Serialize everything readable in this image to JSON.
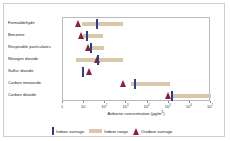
{
  "chart_data": {
    "type": "bar",
    "title": "",
    "xlabel": "Airborne concentration (µg/m³)",
    "ylabel": "",
    "scale": "log10",
    "xlim": [
      1,
      10000000
    ],
    "grid": false,
    "legend_position": "bottom",
    "tick_labels": [
      "1",
      "10",
      "10²",
      "10³",
      "10⁴",
      "10⁵",
      "10⁶",
      "10⁷"
    ],
    "tick_values": [
      1,
      10,
      100,
      1000,
      10000,
      100000,
      1000000,
      10000000
    ],
    "categories": [
      "Formaldehyde",
      "Benzene",
      "Respirable particulates",
      "Nitrogen dioxide",
      "Sulfur dioxide",
      "Carbon monoxide",
      "Carbon dioxide"
    ],
    "series": [
      {
        "name": "Indoor average",
        "color": "#2b3d8f",
        "marker": "vertical-bar",
        "values": [
          40,
          13,
          22,
          45,
          9,
          2500,
          150000
        ]
      },
      {
        "name": "Indoor range",
        "color": "#d9c7ac",
        "marker": "range-bar",
        "ranges": [
          [
            8,
            700
          ],
          [
            9,
            80
          ],
          [
            20,
            90
          ],
          [
            4,
            700
          ],
          null,
          [
            1600,
            120000
          ],
          [
            130000,
            10000000
          ]
        ]
      },
      {
        "name": "Outdoor average",
        "color": "#8c2038",
        "marker": "triangle",
        "values": [
          5,
          7,
          15,
          40,
          18,
          700,
          90000
        ]
      }
    ]
  },
  "legend": {
    "items": [
      {
        "label": "Indoor average",
        "icon": "indoor-average-swatch"
      },
      {
        "label": "Indoor range",
        "icon": "indoor-range-swatch"
      },
      {
        "label": "Outdoor average",
        "icon": "outdoor-average-swatch"
      }
    ]
  },
  "colors": {
    "indoor_average": "#2b3d8f",
    "indoor_range": "#d9c7ac",
    "outdoor_average": "#8c2038",
    "axis": "#8d8d8d",
    "frame": "#cfcfcf",
    "text": "#222222",
    "background": "#ffffff"
  }
}
